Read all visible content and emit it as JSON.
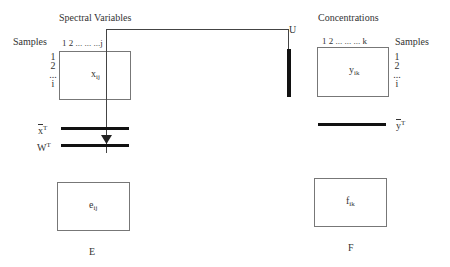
{
  "left": {
    "title": "Spectral Variables",
    "samples_label": "Samples",
    "column_indices": "1 2 ... ... ...j",
    "row_indices": [
      "1",
      "2",
      "...",
      "i"
    ],
    "matrix_cell": {
      "base": "x",
      "sub": "ij"
    },
    "mean_vector": {
      "base": "x",
      "sup": "T"
    },
    "weights": {
      "base": "W",
      "sup": "T"
    },
    "residual_cell": {
      "base": "e",
      "sub": "ij"
    },
    "residual_label": "E"
  },
  "right": {
    "title": "Concentrations",
    "samples_label": "Samples",
    "column_indices": "1  2 ... ... ... k",
    "row_indices": [
      "1",
      "2",
      "...",
      "i"
    ],
    "matrix_cell": {
      "base": "y",
      "sub": "ik"
    },
    "mean_vector": {
      "base": "y",
      "sup": "T"
    },
    "residual_cell": {
      "base": "f",
      "sub": "ik"
    },
    "residual_label": "F"
  },
  "connector": {
    "label": "U"
  },
  "colors": {
    "bar": "#111111",
    "line": "#444444",
    "box_border": "#777777"
  }
}
